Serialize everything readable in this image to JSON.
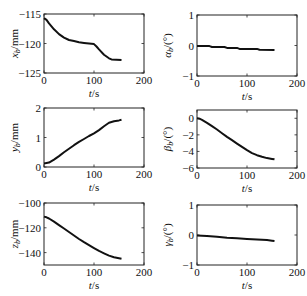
{
  "chart_data": [
    {
      "type": "line",
      "id": "xb",
      "ylabel": "x_b/mm",
      "ylabel_main": "x",
      "ylabel_sub": "b",
      "ylabel_unit": "/mm",
      "xlabel": "t/s",
      "xlim": [
        0,
        200
      ],
      "ylim": [
        -125,
        -115
      ],
      "xticks": [
        0,
        100,
        200
      ],
      "yticks": [
        -115,
        -120,
        -125
      ],
      "x": [
        0,
        5,
        10,
        20,
        30,
        40,
        50,
        60,
        70,
        80,
        90,
        100,
        105,
        110,
        120,
        130,
        135,
        145,
        155
      ],
      "y": [
        -115.7,
        -116.0,
        -116.6,
        -117.6,
        -118.4,
        -119.0,
        -119.4,
        -119.6,
        -119.8,
        -119.9,
        -120.0,
        -120.1,
        -120.5,
        -121.0,
        -121.9,
        -122.5,
        -122.7,
        -122.75,
        -122.8
      ]
    },
    {
      "type": "line",
      "id": "alpha",
      "ylabel": "α_b/(°)",
      "ylabel_main": "α",
      "ylabel_sub": "b",
      "ylabel_unit": "/(°)",
      "xlabel": "t/s",
      "xlim": [
        0,
        200
      ],
      "ylim": [
        -1,
        1
      ],
      "xticks": [
        0,
        100,
        200
      ],
      "yticks": [
        1,
        0,
        -1
      ],
      "x": [
        0,
        25,
        30,
        55,
        60,
        80,
        85,
        120,
        125,
        155
      ],
      "y": [
        -0.02,
        -0.02,
        -0.05,
        -0.05,
        -0.08,
        -0.08,
        -0.11,
        -0.11,
        -0.14,
        -0.15
      ]
    },
    {
      "type": "line",
      "id": "yb",
      "ylabel": "y_b/mm",
      "ylabel_main": "y",
      "ylabel_sub": "b",
      "ylabel_unit": "/mm",
      "xlabel": "t/s",
      "xlim": [
        0,
        200
      ],
      "ylim": [
        0,
        2
      ],
      "xticks": [
        0,
        100,
        200
      ],
      "yticks": [
        2,
        1,
        0
      ],
      "x": [
        0,
        10,
        20,
        30,
        40,
        50,
        60,
        70,
        80,
        90,
        100,
        110,
        120,
        130,
        140,
        150,
        155
      ],
      "y": [
        0.12,
        0.15,
        0.25,
        0.37,
        0.5,
        0.62,
        0.74,
        0.85,
        0.95,
        1.05,
        1.14,
        1.25,
        1.38,
        1.5,
        1.55,
        1.58,
        1.6
      ]
    },
    {
      "type": "line",
      "id": "beta",
      "ylabel": "β_b/(°)",
      "ylabel_main": "β",
      "ylabel_sub": "b",
      "ylabel_unit": "/(°)",
      "xlabel": "t/s",
      "xlim": [
        0,
        200
      ],
      "ylim": [
        -6,
        1
      ],
      "xticks": [
        0,
        100,
        200
      ],
      "yticks": [
        0,
        -2,
        -4,
        -6
      ],
      "x": [
        0,
        5,
        10,
        20,
        30,
        40,
        50,
        60,
        70,
        80,
        90,
        100,
        110,
        120,
        130,
        140,
        150,
        155
      ],
      "y": [
        0,
        -0.05,
        -0.2,
        -0.55,
        -0.95,
        -1.35,
        -1.8,
        -2.25,
        -2.65,
        -3.05,
        -3.45,
        -3.85,
        -4.2,
        -4.45,
        -4.65,
        -4.8,
        -4.9,
        -4.95
      ]
    },
    {
      "type": "line",
      "id": "zb",
      "ylabel": "z_b/mm",
      "ylabel_main": "z",
      "ylabel_sub": "b",
      "ylabel_unit": "/mm",
      "xlabel": "t/s",
      "xlim": [
        0,
        200
      ],
      "ylim": [
        -150,
        -100
      ],
      "xticks": [
        0,
        100,
        200
      ],
      "yticks": [
        -100,
        -120,
        -140
      ],
      "x": [
        0,
        5,
        10,
        20,
        30,
        40,
        50,
        60,
        70,
        80,
        90,
        100,
        110,
        120,
        130,
        140,
        150,
        155
      ],
      "y": [
        -111,
        -111.5,
        -112.5,
        -115,
        -117.8,
        -120.6,
        -123.4,
        -126.2,
        -129,
        -131.6,
        -134,
        -136.4,
        -138.6,
        -140.6,
        -142.4,
        -143.8,
        -144.6,
        -145
      ]
    },
    {
      "type": "line",
      "id": "gamma",
      "ylabel": "γ_b/(°)",
      "ylabel_main": "γ",
      "ylabel_sub": "b",
      "ylabel_unit": "/(°)",
      "xlabel": "t/s",
      "xlim": [
        0,
        200
      ],
      "ylim": [
        -1,
        1
      ],
      "xticks": [
        0,
        100,
        200
      ],
      "yticks": [
        1,
        0,
        -1
      ],
      "x": [
        0,
        20,
        40,
        60,
        80,
        100,
        120,
        140,
        150,
        155
      ],
      "y": [
        -0.02,
        -0.03,
        -0.06,
        -0.09,
        -0.11,
        -0.13,
        -0.15,
        -0.17,
        -0.19,
        -0.2
      ]
    }
  ]
}
